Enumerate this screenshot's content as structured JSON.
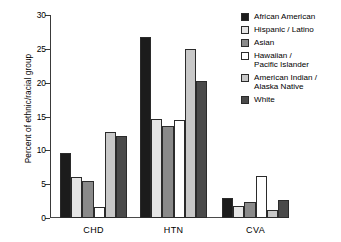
{
  "chart_data": {
    "type": "bar",
    "title": "",
    "subtitle": "",
    "xlabel": "",
    "ylabel": "Percent of ethnic/racial group",
    "categories": [
      "CHD",
      "HTN",
      "CVA"
    ],
    "ylim": [
      0,
      30
    ],
    "yticks": [
      0,
      5,
      10,
      15,
      20,
      25,
      30
    ],
    "ytick_labels": [
      "0",
      "5",
      "10",
      "15",
      "20",
      "25",
      "30"
    ],
    "grid": false,
    "legend_position": "right",
    "orientation": "vertical",
    "series": [
      {
        "name": "African American",
        "color": "#1c1c1c",
        "values": [
          9.6,
          26.8,
          3.0
        ]
      },
      {
        "name": "Hispanic / Latino",
        "color": "#e6e6e6",
        "values": [
          6.0,
          14.6,
          1.8
        ]
      },
      {
        "name": "Asian",
        "color": "#8a8a8a",
        "values": [
          5.4,
          13.6,
          2.3
        ]
      },
      {
        "name": "Hawaiian /\nPacific Islander",
        "color": "#ffffff",
        "values": [
          1.7,
          14.5,
          6.2
        ]
      },
      {
        "name": "American Indian /\nAlaska Native",
        "color": "#c8c8c8",
        "values": [
          12.7,
          25.0,
          1.2
        ]
      },
      {
        "name": "White",
        "color": "#4a4a4a",
        "values": [
          12.1,
          20.2,
          2.6
        ]
      }
    ]
  },
  "axis": {
    "y_label": "Percent of ethnic/racial group"
  },
  "colors": {
    "axis": "#3a3a3a",
    "bar_outline": "#2b2b2b",
    "background": "#ffffff"
  }
}
